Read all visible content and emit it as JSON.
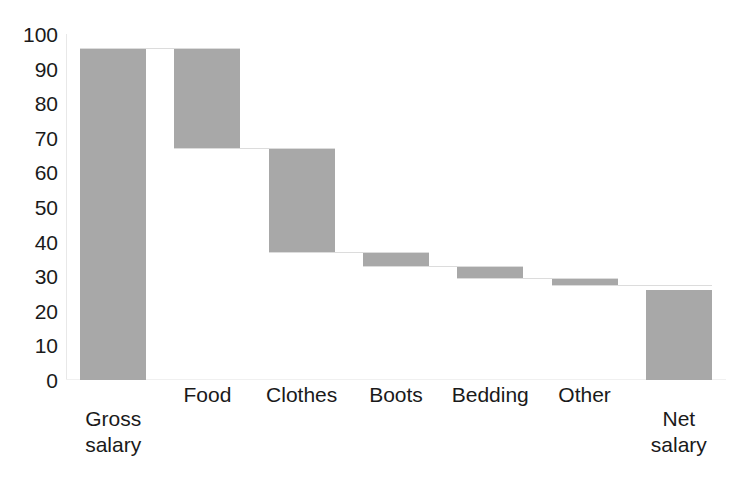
{
  "chart_data": {
    "type": "bar",
    "chart_subtype": "waterfall",
    "title": "",
    "xlabel": "",
    "ylabel": "",
    "categories": [
      "Gross\nsalary",
      "Food",
      "Clothes",
      "Boots",
      "Bedding",
      "Other",
      "Net\nsalary"
    ],
    "values": [
      96,
      -29,
      -30,
      -4,
      -3.5,
      -2,
      26
    ],
    "cumulative_start": [
      0,
      96,
      67,
      37,
      33,
      29.5,
      0
    ],
    "cumulative_end": [
      96,
      67,
      37,
      33,
      29.5,
      27.5,
      26
    ],
    "bar_types": [
      "total",
      "decrease",
      "decrease",
      "decrease",
      "decrease",
      "decrease",
      "total"
    ],
    "ylim": [
      0,
      100
    ],
    "yticks": [
      0,
      10,
      20,
      30,
      40,
      50,
      60,
      70,
      80,
      90,
      100
    ],
    "ytick_labels": [
      "0",
      "10",
      "20",
      "30",
      "40",
      "50",
      "60",
      "70",
      "80",
      "90",
      "100"
    ],
    "grid": false,
    "legend": null,
    "bar_color": "#a8a8a8",
    "axis_color": "#e8e8e8",
    "text_color": "#1a1a1a",
    "background": "#ffffff"
  }
}
